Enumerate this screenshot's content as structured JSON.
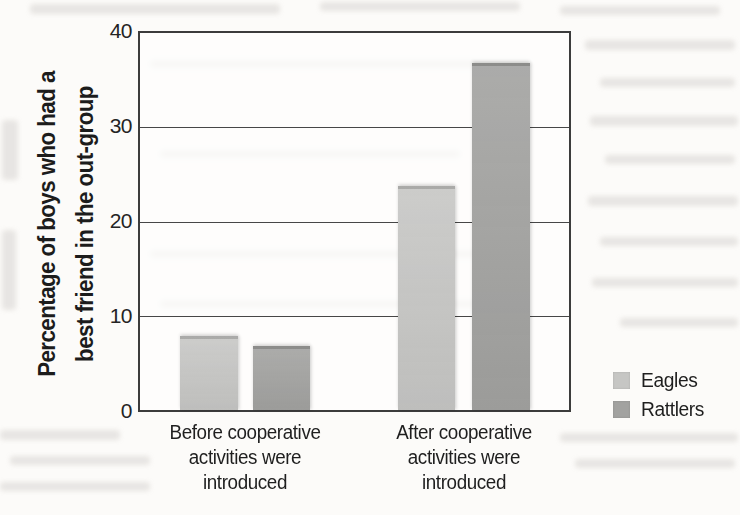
{
  "figure": {
    "kind": "scanned-textbook-bar-chart",
    "background_color": "#fcfbf9",
    "axis_color": "#3c3c3c",
    "text_color": "#1e1e1e"
  },
  "chart_data": {
    "type": "bar",
    "title": "",
    "xlabel": "",
    "ylabel": "Percentage of boys who had a best friend in the out-group",
    "ylabel_lines": [
      "Percentage of boys who had a",
      "best friend in the out-group"
    ],
    "ylim": [
      0,
      40
    ],
    "yticks": [
      0,
      10,
      20,
      30,
      40
    ],
    "ytick_labels_top_to_bottom": [
      "40",
      "30",
      "20",
      "10",
      "0"
    ],
    "grid": "horizontal gridlines at 10, 20, 30; full box border",
    "categories": [
      "Before cooperative activities were introduced",
      "After cooperative activities were introduced"
    ],
    "categories_lines": [
      [
        "Before cooperative",
        "activities were",
        "introduced"
      ],
      [
        "After cooperative",
        "activities were",
        "introduced"
      ]
    ],
    "series": [
      {
        "name": "Eagles",
        "color": "#c6c6c4",
        "values": [
          7.5,
          23.5
        ]
      },
      {
        "name": "Rattlers",
        "color": "#a2a2a0",
        "values": [
          6.5,
          36.5
        ]
      }
    ],
    "legend_position": "right of plot, lower area"
  }
}
